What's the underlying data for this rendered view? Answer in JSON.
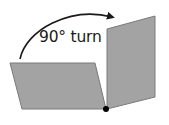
{
  "diagram": {
    "label": "90° turn",
    "colors": {
      "face_fill": "#a3a3a3",
      "face_stroke": "#7a7a7a",
      "arrow": "#1a1a1a",
      "pivot": "#000000",
      "background": "#ffffff"
    },
    "shapes": {
      "left_face": "10,63 95,63 106,109 22,109",
      "right_face": "107,29 155,16 155,97 107,109",
      "pivot_point": {
        "cx": 106,
        "cy": 109,
        "r": 3
      }
    },
    "arrow": {
      "path": "M20,59 C26,30 70,6 112,17",
      "direction": "clockwise"
    }
  }
}
